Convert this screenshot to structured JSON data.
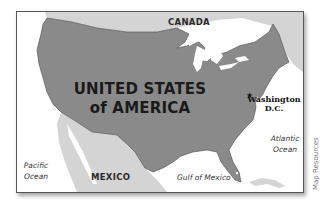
{
  "map": {
    "title_line1": "UNITED STATES",
    "title_line2": "of AMERICA",
    "countries": {
      "canada": "CANADA",
      "mexico": "MEXICO"
    },
    "capital": {
      "line1": "Washington",
      "line2": "D.C.",
      "marker": "★"
    },
    "water_bodies": {
      "pacific_line1": "Pacific",
      "pacific_line2": "Ocean",
      "atlantic_line1": "Atlantic",
      "atlantic_line2": "Ocean",
      "gulf": "Gulf of Mexico"
    },
    "credit": "Map Resources",
    "colors": {
      "usa_fill": "#8a8a8a",
      "neighbor_fill": "#d4d4d4",
      "water": "#ffffff",
      "border": "#555555"
    }
  }
}
